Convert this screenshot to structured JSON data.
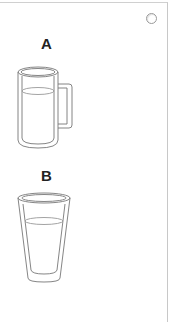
{
  "options": [
    {
      "label": "A",
      "item": "mug-with-liquid"
    },
    {
      "label": "B",
      "item": "glass-with-liquid"
    }
  ],
  "radio": {
    "selected": false
  }
}
